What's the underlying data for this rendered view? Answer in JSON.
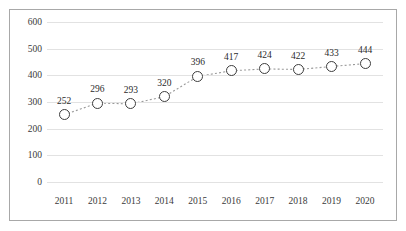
{
  "figure": {
    "background_color": "#ffffff",
    "border_color": "#a8a8a8",
    "gridline_color": "#e2e2e2",
    "marker_edge_color": "#3d3d3d",
    "marker_fill_color": "#ffffff",
    "line_color": "#9a9a9a",
    "partial_title_remnant": ""
  },
  "chart_data": {
    "type": "line",
    "title": "",
    "subtitle": "",
    "xlabel": "",
    "ylabel": "",
    "categories": [
      "2011",
      "2012",
      "2013",
      "2014",
      "2015",
      "2016",
      "2017",
      "2018",
      "2019",
      "2020"
    ],
    "values": [
      252,
      296,
      293,
      320,
      396,
      417,
      424,
      422,
      433,
      444
    ],
    "data_labels": [
      "252",
      "296",
      "293",
      "320",
      "396",
      "417",
      "424",
      "422",
      "433",
      "444"
    ],
    "ylim": [
      0,
      600
    ],
    "yticks": [
      0,
      100,
      200,
      300,
      400,
      500,
      600
    ],
    "ytick_labels": [
      "0",
      "100",
      "200",
      "300",
      "400",
      "500",
      "600"
    ],
    "grid": "horizontal-only",
    "legend": "none",
    "line_style": "dotted",
    "marker": "open-circle",
    "series": [
      {
        "name": "",
        "values": [
          252,
          296,
          293,
          320,
          396,
          417,
          424,
          422,
          433,
          444
        ]
      }
    ],
    "annotations": []
  }
}
